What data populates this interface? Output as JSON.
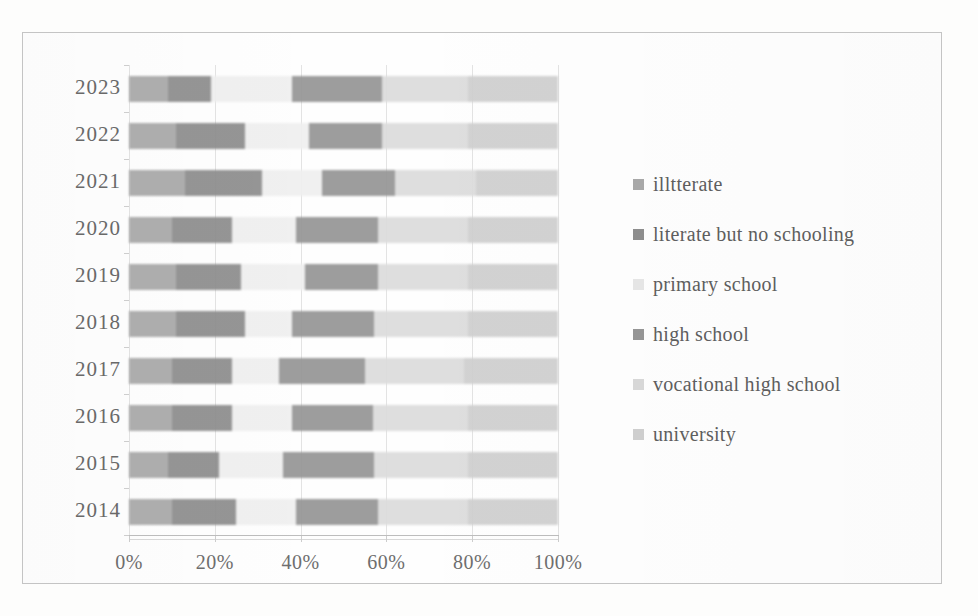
{
  "top_fragment": "",
  "chart_data": {
    "type": "bar",
    "stacked": true,
    "orientation": "horizontal",
    "normalized": "100%",
    "title": "",
    "xlabel": "",
    "ylabel": "",
    "xlim": [
      0,
      100
    ],
    "grid": true,
    "legend_position": "right",
    "categories": [
      "2023",
      "2022",
      "2021",
      "2020",
      "2019",
      "2018",
      "2017",
      "2016",
      "2015",
      "2014"
    ],
    "xticks": [
      "0%",
      "20%",
      "40%",
      "60%",
      "80%",
      "100%"
    ],
    "xtick_values": [
      0,
      20,
      40,
      60,
      80,
      100
    ],
    "series": [
      {
        "name": "illtterate",
        "color": "#a9a9a9",
        "values": [
          9,
          11,
          13,
          10,
          11,
          11,
          10,
          10,
          9,
          10
        ]
      },
      {
        "name": "literate but no schooling",
        "color": "#8e8e8e",
        "values": [
          10,
          16,
          18,
          14,
          15,
          16,
          14,
          14,
          12,
          15
        ]
      },
      {
        "name": "primary school",
        "color": "#efefef",
        "values": [
          19,
          15,
          14,
          15,
          15,
          11,
          11,
          14,
          15,
          14
        ]
      },
      {
        "name": "high school",
        "color": "#969696",
        "values": [
          21,
          17,
          17,
          19,
          17,
          19,
          20,
          19,
          21,
          19
        ]
      },
      {
        "name": "vocational high school",
        "color": "#dcdcdc",
        "values": [
          20,
          20,
          19,
          21,
          21,
          22,
          23,
          22,
          22,
          21
        ]
      },
      {
        "name": "university",
        "color": "#cfcfcf",
        "values": [
          21,
          21,
          19,
          21,
          21,
          21,
          22,
          21,
          21,
          21
        ]
      }
    ]
  },
  "legend": {
    "items": [
      {
        "label": "illtterate",
        "swatch": "#a9a9a9"
      },
      {
        "label": "literate but no schooling",
        "swatch": "#8e8e8e"
      },
      {
        "label": "primary school",
        "swatch": "#e6e6e6"
      },
      {
        "label": "high school",
        "swatch": "#969696"
      },
      {
        "label": "vocational high school",
        "swatch": "#d8d8d8"
      },
      {
        "label": "university",
        "swatch": "#cfcfcf"
      }
    ]
  }
}
